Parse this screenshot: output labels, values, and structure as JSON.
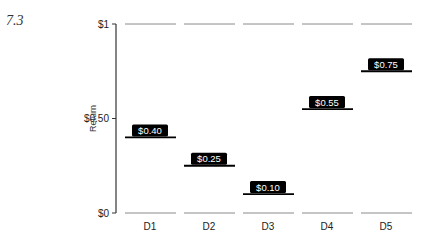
{
  "figure_label": "7.3",
  "chart_data": {
    "type": "bar",
    "style": "level-markers",
    "title": "",
    "xlabel": "",
    "ylabel": "Return",
    "categories": [
      "D1",
      "D2",
      "D3",
      "D4",
      "D5"
    ],
    "values": [
      0.4,
      0.25,
      0.1,
      0.55,
      0.75
    ],
    "value_labels": [
      "$0.40",
      "$0.25",
      "$0.10",
      "$0.55",
      "$0.75"
    ],
    "yticks": [
      0,
      0.5,
      1
    ],
    "ytick_labels": [
      "$0",
      "$0.50",
      "$1"
    ],
    "ylim": [
      0,
      1
    ],
    "reference_lines": [
      0,
      1
    ],
    "grid": false,
    "legend": null
  },
  "colors": {
    "marker": "#000000",
    "label_bg": "#000000",
    "label_text": "#ffffff",
    "reference_line": "#8a8a8a",
    "axis": "#333333"
  }
}
